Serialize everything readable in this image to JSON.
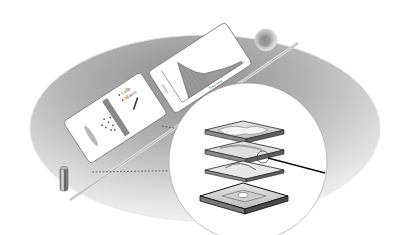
{
  "figure": {
    "background_color": "#ffffff",
    "platform_color": "#b5b5b5"
  },
  "scatter_panel": {
    "legend": [
      {
        "label": "Cells",
        "marker": "dot"
      },
      {
        "label": "Matrix",
        "marker": "dot"
      }
    ]
  },
  "histogram_panel": {
    "y_label": "Count",
    "x_label": "Time (ms)"
  },
  "callout": {
    "layers": [
      "top-cover",
      "channel-layer",
      "spacer-layer",
      "base-plate"
    ]
  },
  "objects": {
    "sphere": "cell-sphere",
    "cylinder": "sample-vial",
    "rod": "guide-rod"
  }
}
